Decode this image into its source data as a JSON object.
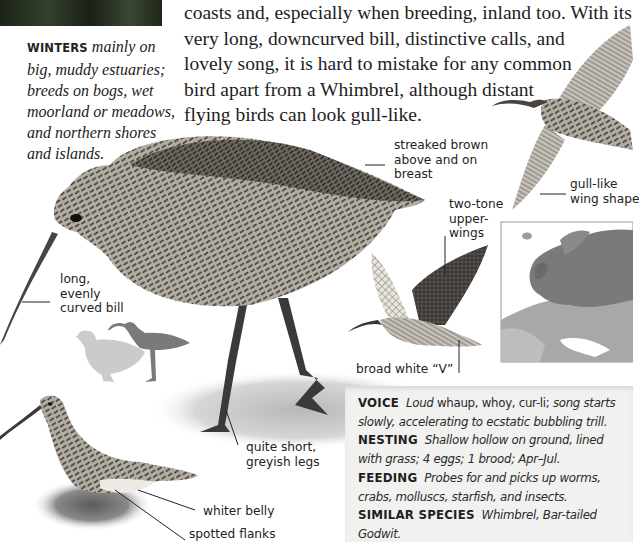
{
  "page": {
    "species": "Curlew",
    "habitat_caption": {
      "heading": "WINTERS",
      "lines": [
        "mainly on",
        "big, muddy estuaries;",
        "breeds on bogs, wet",
        "moorland or meadows,",
        "and northern shores",
        "and islands."
      ]
    },
    "intro_lines": [
      "coasts and, especially when breeding, inland too. With its",
      "very long, downcurved bill, distinctive calls, and",
      "lovely song, it is hard to mistake for any common",
      "bird apart from a Whimbrel, although distant",
      "flying birds can look gull-like."
    ],
    "annotations": {
      "streaked": [
        "streaked brown",
        "above and on",
        "breast"
      ],
      "gull_wing": [
        "gull-like",
        "wing shape"
      ],
      "two_tone": [
        "two-tone",
        "upper-",
        "wings"
      ],
      "bill": [
        "long,",
        "evenly",
        "curved bill"
      ],
      "broad_v": "broad white “V”",
      "legs": [
        "quite short,",
        "greyish legs"
      ],
      "belly": "whiter belly",
      "flanks": "spotted flanks"
    },
    "illustrations": {
      "flying_top": "curlew-flying-gull-like-illustration",
      "standing_main": "curlew-standing-illustration",
      "flying_mid": "curlew-flight-two-tone-illustration",
      "wading": "curlew-wading-illustration",
      "size_silhouettes": "size-comparison-silhouettes",
      "range_map": "europe-range-map"
    },
    "info": {
      "voice": {
        "key": "VOICE",
        "italic_lead": "Loud",
        "plain": " whaup, whoy, cur-li;",
        "italic_rest_1": " song starts",
        "italic_line2": "slowly, accelerating to ecstatic bubbling trill."
      },
      "nesting": {
        "key": "NESTING",
        "line1": "Shallow hollow on ground, lined",
        "line2": "with grass; 4 eggs; 1 brood; Apr–Jul."
      },
      "feeding": {
        "key": "FEEDING",
        "line1": "Probes for and picks up worms,",
        "line2": "crabs, molluscs, starfish, and insects."
      },
      "similar": {
        "key": "SIMILAR SPECIES",
        "line1": "Whimbrel, Bar-tailed",
        "line2": "Godwit."
      }
    },
    "colors": {
      "infobox_bg": "#f1f1f0",
      "text": "#1d1d1d",
      "map_land": "#9a9a9a",
      "map_range": "#6e6e6e"
    }
  }
}
